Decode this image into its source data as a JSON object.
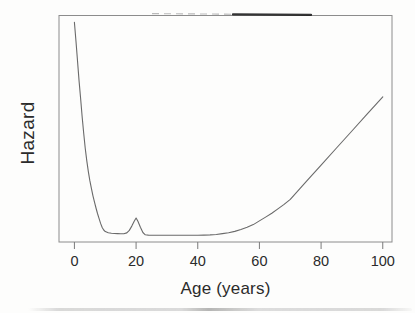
{
  "chart_data": {
    "type": "line",
    "title": "",
    "xlabel": "Age (years)",
    "ylabel": "Hazard",
    "x_ticks": [
      0,
      20,
      40,
      60,
      80,
      100
    ],
    "x_tick_labels": [
      "0",
      "20",
      "40",
      "60",
      "80",
      "100"
    ],
    "xlim": [
      -5,
      103
    ],
    "ylim": [
      0,
      1
    ],
    "y_ticks": [],
    "grid": false,
    "legend": null,
    "frame": "full-box",
    "y_units_note": "y axis has no tick marks or numbers; hazard values below are relative fractions of plot height",
    "series": [
      {
        "name": "hazard",
        "points": [
          [
            0,
            0.97
          ],
          [
            0.5,
            0.885
          ],
          [
            1,
            0.8
          ],
          [
            1.5,
            0.715
          ],
          [
            2,
            0.635
          ],
          [
            2.5,
            0.555
          ],
          [
            3,
            0.48
          ],
          [
            3.5,
            0.415
          ],
          [
            4,
            0.358
          ],
          [
            4.5,
            0.312
          ],
          [
            5,
            0.272
          ],
          [
            5.5,
            0.237
          ],
          [
            6,
            0.205
          ],
          [
            6.5,
            0.176
          ],
          [
            7,
            0.15
          ],
          [
            7.5,
            0.126
          ],
          [
            8,
            0.103
          ],
          [
            8.5,
            0.082
          ],
          [
            9,
            0.064
          ],
          [
            9.5,
            0.053
          ],
          [
            10,
            0.046
          ],
          [
            11,
            0.0405
          ],
          [
            12,
            0.0385
          ],
          [
            13,
            0.0375
          ],
          [
            14,
            0.037
          ],
          [
            15,
            0.0365
          ],
          [
            16,
            0.036
          ],
          [
            17,
            0.04
          ],
          [
            17.8,
            0.051
          ],
          [
            18.6,
            0.07
          ],
          [
            19.4,
            0.092
          ],
          [
            20,
            0.106
          ],
          [
            20.6,
            0.092
          ],
          [
            21.4,
            0.065
          ],
          [
            22.2,
            0.042
          ],
          [
            23,
            0.032
          ],
          [
            24,
            0.0305
          ],
          [
            26,
            0.03
          ],
          [
            28,
            0.03
          ],
          [
            30,
            0.03
          ],
          [
            32,
            0.03
          ],
          [
            34,
            0.03
          ],
          [
            36,
            0.03
          ],
          [
            38,
            0.03
          ],
          [
            40,
            0.03
          ],
          [
            42,
            0.0305
          ],
          [
            44,
            0.0315
          ],
          [
            46,
            0.033
          ],
          [
            48,
            0.037
          ],
          [
            50,
            0.041
          ],
          [
            52,
            0.047
          ],
          [
            54,
            0.055
          ],
          [
            56,
            0.065
          ],
          [
            58,
            0.077
          ],
          [
            60,
            0.093
          ],
          [
            62,
            0.11
          ],
          [
            64,
            0.127
          ],
          [
            66,
            0.146
          ],
          [
            68,
            0.166
          ],
          [
            70,
            0.188
          ],
          [
            75,
            0.264
          ],
          [
            80,
            0.339
          ],
          [
            85,
            0.415
          ],
          [
            90,
            0.49
          ],
          [
            95,
            0.566
          ],
          [
            100,
            0.641
          ]
        ]
      }
    ],
    "annotations": [
      "steep infant-mortality decline from age 0 to ~10",
      "small accident hump peaking near age 20",
      "flat minimum plateau from ~age 22 to ~48",
      "nearly linear rise from ~age 70 to 100"
    ]
  },
  "colors": {
    "background": "#fdfdfc",
    "curve": "#6a6a6a",
    "frame": "#8c8c8c",
    "tick": "#7a7a7a",
    "text": "#2b2b2b",
    "scan_smudge_dark": "#1f1f1f",
    "scan_smudge_light": "#b3b3b3"
  }
}
